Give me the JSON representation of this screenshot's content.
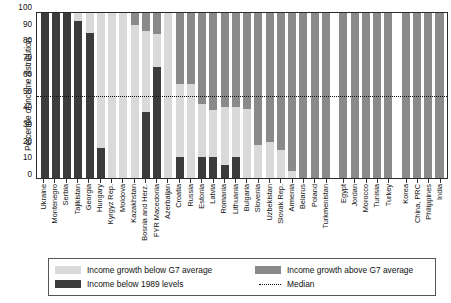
{
  "chart_data": {
    "type": "bar",
    "title": "",
    "xlabel": "",
    "ylabel": "Percentile of income distribution",
    "ylim": [
      0,
      100
    ],
    "yticks": [
      100,
      90,
      80,
      70,
      60,
      50,
      40,
      30,
      20,
      10,
      0
    ],
    "grid": false,
    "stacked": true,
    "orientation": "vertical",
    "median_line": 50,
    "legend_position": "bottom",
    "series": [
      {
        "name": "Income below 1989 levels",
        "color": "#3c3c3c"
      },
      {
        "name": "Income growth below G7 average",
        "color": "#d9d9d9"
      },
      {
        "name": "Income growth above G7 average",
        "color": "#8a8a8a"
      }
    ],
    "categories": [
      "Ukraine",
      "Montenegro",
      "Serbia",
      "Tajikistan",
      "Georgia",
      "Hungary",
      "Kyrgyz Rep.",
      "Moldova",
      "Kazakhstan",
      "Bosnia and Herz.",
      "FYR Macedonia",
      "Azerbaijan",
      "Croatia",
      "Russia",
      "Estonia",
      "Latvia",
      "Romania",
      "Lithuania",
      "Bulgaria",
      "Slovenia",
      "Uzbekistan",
      "Slovak Rep.",
      "Armenia",
      "Belarus",
      "Poland",
      "Turkmenistan",
      "Egypt",
      "Jordan",
      "Morocco",
      "Tunisia",
      "Turkey",
      "Korea",
      "China, PRC",
      "Philippines",
      "India"
    ],
    "group_breaks_after": [
      "Turkmenistan",
      "Turkey"
    ],
    "bars": [
      {
        "category": "Ukraine",
        "below_1989": 100,
        "growth_below_g7": 0,
        "growth_above_g7": 0
      },
      {
        "category": "Montenegro",
        "below_1989": 100,
        "growth_below_g7": 0,
        "growth_above_g7": 0
      },
      {
        "category": "Serbia",
        "below_1989": 100,
        "growth_below_g7": 0,
        "growth_above_g7": 0
      },
      {
        "category": "Tajikistan",
        "below_1989": 95,
        "growth_below_g7": 5,
        "growth_above_g7": 0
      },
      {
        "category": "Georgia",
        "below_1989": 88,
        "growth_below_g7": 12,
        "growth_above_g7": 0
      },
      {
        "category": "Hungary",
        "below_1989": 18,
        "growth_below_g7": 82,
        "growth_above_g7": 0
      },
      {
        "category": "Kyrgyz Rep.",
        "below_1989": 0,
        "growth_below_g7": 100,
        "growth_above_g7": 0
      },
      {
        "category": "Moldova",
        "below_1989": 0,
        "growth_below_g7": 100,
        "growth_above_g7": 0
      },
      {
        "category": "Kazakhstan",
        "below_1989": 0,
        "growth_below_g7": 93,
        "growth_above_g7": 7
      },
      {
        "category": "Bosnia and Herz.",
        "below_1989": 40,
        "growth_below_g7": 49,
        "growth_above_g7": 11
      },
      {
        "category": "FYR Macedonia",
        "below_1989": 67,
        "growth_below_g7": 20,
        "growth_above_g7": 13
      },
      {
        "category": "Azerbaijan",
        "below_1989": 0,
        "growth_below_g7": 100,
        "growth_above_g7": 0
      },
      {
        "category": "Croatia",
        "below_1989": 13,
        "growth_below_g7": 44,
        "growth_above_g7": 43
      },
      {
        "category": "Russia",
        "below_1989": 0,
        "growth_below_g7": 57,
        "growth_above_g7": 43
      },
      {
        "category": "Estonia",
        "below_1989": 13,
        "growth_below_g7": 32,
        "growth_above_g7": 55
      },
      {
        "category": "Latvia",
        "below_1989": 13,
        "growth_below_g7": 28,
        "growth_above_g7": 59
      },
      {
        "category": "Romania",
        "below_1989": 8,
        "growth_below_g7": 35,
        "growth_above_g7": 57
      },
      {
        "category": "Lithuania",
        "below_1989": 13,
        "growth_below_g7": 30,
        "growth_above_g7": 57
      },
      {
        "category": "Bulgaria",
        "below_1989": 0,
        "growth_below_g7": 42,
        "growth_above_g7": 58
      },
      {
        "category": "Slovenia",
        "below_1989": 0,
        "growth_below_g7": 20,
        "growth_above_g7": 80
      },
      {
        "category": "Uzbekistan",
        "below_1989": 0,
        "growth_below_g7": 22,
        "growth_above_g7": 78
      },
      {
        "category": "Slovak Rep.",
        "below_1989": 0,
        "growth_below_g7": 17,
        "growth_above_g7": 83
      },
      {
        "category": "Armenia",
        "below_1989": 0,
        "growth_below_g7": 4,
        "growth_above_g7": 96
      },
      {
        "category": "Belarus",
        "below_1989": 0,
        "growth_below_g7": 0,
        "growth_above_g7": 100
      },
      {
        "category": "Poland",
        "below_1989": 0,
        "growth_below_g7": 0,
        "growth_above_g7": 100
      },
      {
        "category": "Turkmenistan",
        "below_1989": 0,
        "growth_below_g7": 0,
        "growth_above_g7": 100
      },
      {
        "category": "Egypt",
        "below_1989": 0,
        "growth_below_g7": 0,
        "growth_above_g7": 100
      },
      {
        "category": "Jordan",
        "below_1989": 0,
        "growth_below_g7": 0,
        "growth_above_g7": 100
      },
      {
        "category": "Morocco",
        "below_1989": 0,
        "growth_below_g7": 0,
        "growth_above_g7": 100
      },
      {
        "category": "Tunisia",
        "below_1989": 0,
        "growth_below_g7": 0,
        "growth_above_g7": 100
      },
      {
        "category": "Turkey",
        "below_1989": 0,
        "growth_below_g7": 0,
        "growth_above_g7": 100
      },
      {
        "category": "Korea",
        "below_1989": 0,
        "growth_below_g7": 0,
        "growth_above_g7": 100
      },
      {
        "category": "China, PRC",
        "below_1989": 0,
        "growth_below_g7": 0,
        "growth_above_g7": 100
      },
      {
        "category": "Philippines",
        "below_1989": 0,
        "growth_below_g7": 0,
        "growth_above_g7": 100
      },
      {
        "category": "India",
        "below_1989": 0,
        "growth_below_g7": 0,
        "growth_above_g7": 100
      }
    ]
  },
  "legend": {
    "items": [
      {
        "key": "growth_below_g7",
        "label": "Income growth below G7 average",
        "swatch": "below"
      },
      {
        "key": "growth_above_g7",
        "label": "Income growth above G7 average",
        "swatch": "above"
      },
      {
        "key": "below_1989",
        "label": "Income below 1989 levels",
        "swatch": "b89"
      },
      {
        "key": "median",
        "label": "Median",
        "swatch": "med"
      }
    ]
  },
  "colors": {
    "growth_above_g7": "#8a8a8a",
    "growth_below_g7": "#d9d9d9",
    "below_1989": "#3c3c3c",
    "median": "#111111",
    "axis": "#2a2a2a"
  }
}
